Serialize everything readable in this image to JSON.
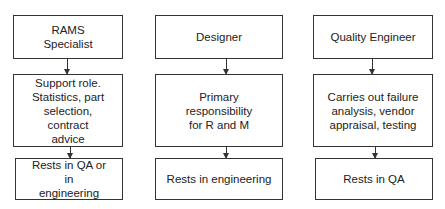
{
  "diagram": {
    "columns": [
      {
        "role": "RAMS\nSpecialist",
        "role_lines": [
          "RAMS",
          "Specialist"
        ],
        "description_lines": [
          "Support role.",
          "Statistics, part",
          "selection, contract",
          "advice"
        ],
        "location_lines": [
          "Rests in QA or in",
          "engineering"
        ]
      },
      {
        "role_lines": [
          "Designer"
        ],
        "description_lines": [
          "Primary responsibility",
          "for R and M"
        ],
        "location_lines": [
          "Rests in engineering"
        ]
      },
      {
        "role_lines": [
          "Quality Engineer"
        ],
        "description_lines": [
          "Carries out failure",
          "analysis, vendor",
          "appraisal, testing"
        ],
        "location_lines": [
          "Rests in QA"
        ]
      }
    ],
    "colors": {
      "line": "#333333",
      "text": "#222222",
      "background": "#ffffff"
    }
  }
}
